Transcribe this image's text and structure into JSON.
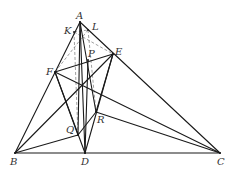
{
  "diagram": {
    "title": "",
    "points": [
      {
        "id": "A",
        "label": "A"
      },
      {
        "id": "B",
        "label": "B"
      },
      {
        "id": "C",
        "label": "C"
      },
      {
        "id": "D",
        "label": "D"
      },
      {
        "id": "E",
        "label": "E"
      },
      {
        "id": "F",
        "label": "F"
      },
      {
        "id": "K",
        "label": "K"
      },
      {
        "id": "L",
        "label": "L"
      },
      {
        "id": "P",
        "label": "P"
      },
      {
        "id": "Q",
        "label": "Q"
      },
      {
        "id": "R",
        "label": "R"
      }
    ],
    "solid_segments": [
      [
        "A",
        "B"
      ],
      [
        "A",
        "C"
      ],
      [
        "B",
        "C"
      ],
      [
        "A",
        "D"
      ],
      [
        "B",
        "E"
      ],
      [
        "C",
        "F"
      ],
      [
        "E",
        "F"
      ],
      [
        "F",
        "D"
      ],
      [
        "D",
        "E"
      ],
      [
        "B",
        "Q"
      ],
      [
        "Q",
        "R"
      ],
      [
        "R",
        "C"
      ],
      [
        "F",
        "Q"
      ],
      [
        "A",
        "Q"
      ],
      [
        "A",
        "R"
      ],
      [
        "P",
        "D"
      ],
      [
        "E",
        "R"
      ]
    ],
    "dashed_segments": [
      [
        "K",
        "Q"
      ],
      [
        "L",
        "R"
      ],
      [
        "K",
        "E"
      ],
      [
        "L",
        "F"
      ],
      [
        "K",
        "L"
      ]
    ]
  }
}
